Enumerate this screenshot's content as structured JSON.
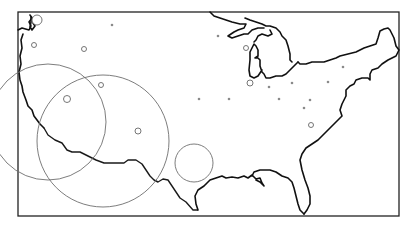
{
  "map": {
    "subject": "Continental United States outline with proportional circle markers",
    "frame": {
      "x": 18,
      "y": 12,
      "width": 381,
      "height": 204
    },
    "colors": {
      "background": "#ffffff",
      "outline": "#111111",
      "circle_stroke": "#6e6e6e",
      "dot_fill": "#8a8a8a"
    },
    "large_circles": [
      {
        "cx": 48,
        "cy": 122,
        "r": 58
      },
      {
        "cx": 103,
        "cy": 141,
        "r": 66
      },
      {
        "cx": 194,
        "cy": 163,
        "r": 19
      }
    ],
    "small_circles": [
      {
        "cx": 37,
        "cy": 20,
        "r": 5
      },
      {
        "cx": 34,
        "cy": 45,
        "r": 2.5
      },
      {
        "cx": 84,
        "cy": 49,
        "r": 2.5
      },
      {
        "cx": 101,
        "cy": 85,
        "r": 2.5
      },
      {
        "cx": 67,
        "cy": 99,
        "r": 3.5
      },
      {
        "cx": 138,
        "cy": 131,
        "r": 3
      },
      {
        "cx": 246,
        "cy": 48,
        "r": 2.5
      },
      {
        "cx": 250,
        "cy": 83,
        "r": 3
      },
      {
        "cx": 311,
        "cy": 125,
        "r": 2.5
      }
    ],
    "dots": [
      {
        "cx": 112,
        "cy": 25
      },
      {
        "cx": 218,
        "cy": 36
      },
      {
        "cx": 199,
        "cy": 99
      },
      {
        "cx": 229,
        "cy": 99
      },
      {
        "cx": 269,
        "cy": 87
      },
      {
        "cx": 292,
        "cy": 83
      },
      {
        "cx": 279,
        "cy": 99
      },
      {
        "cx": 310,
        "cy": 100
      },
      {
        "cx": 328,
        "cy": 82
      },
      {
        "cx": 343,
        "cy": 67
      },
      {
        "cx": 304,
        "cy": 108
      }
    ]
  }
}
